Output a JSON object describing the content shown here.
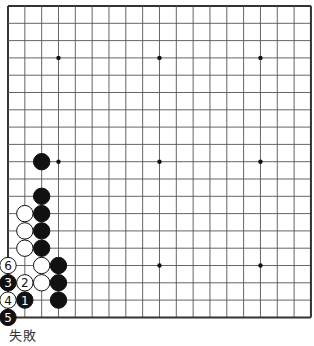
{
  "board": {
    "size": 19,
    "origin_x": 8,
    "origin_y": 6,
    "step_x": 16.83,
    "step_y": 17.3,
    "line_color": "#555555",
    "border_color": "#333333",
    "star_points": [
      [
        3,
        3
      ],
      [
        9,
        3
      ],
      [
        15,
        3
      ],
      [
        3,
        9
      ],
      [
        9,
        9
      ],
      [
        15,
        9
      ],
      [
        3,
        15
      ],
      [
        9,
        15
      ],
      [
        15,
        15
      ]
    ],
    "stones": [
      {
        "color": "black",
        "col": 2,
        "row": 9,
        "label": ""
      },
      {
        "color": "black",
        "col": 2,
        "row": 11,
        "label": ""
      },
      {
        "color": "black",
        "col": 2,
        "row": 12,
        "label": ""
      },
      {
        "color": "black",
        "col": 2,
        "row": 13,
        "label": ""
      },
      {
        "color": "black",
        "col": 2,
        "row": 14,
        "label": ""
      },
      {
        "color": "white",
        "col": 1,
        "row": 12,
        "label": ""
      },
      {
        "color": "white",
        "col": 1,
        "row": 13,
        "label": ""
      },
      {
        "color": "white",
        "col": 1,
        "row": 14,
        "label": ""
      },
      {
        "color": "white",
        "col": 2,
        "row": 15,
        "label": ""
      },
      {
        "color": "black",
        "col": 3,
        "row": 15,
        "label": ""
      },
      {
        "color": "white",
        "col": 2,
        "row": 16,
        "label": ""
      },
      {
        "color": "black",
        "col": 3,
        "row": 16,
        "label": ""
      },
      {
        "color": "black",
        "col": 3,
        "row": 17,
        "label": ""
      },
      {
        "color": "black",
        "col": 1,
        "row": 17,
        "label": "1"
      },
      {
        "color": "white",
        "col": 1,
        "row": 16,
        "label": "2"
      },
      {
        "color": "black",
        "col": 0,
        "row": 16,
        "label": "3"
      },
      {
        "color": "white",
        "col": 0,
        "row": 17,
        "label": "4"
      },
      {
        "color": "black",
        "col": 0,
        "row": 18,
        "label": "5"
      },
      {
        "color": "white",
        "col": 0,
        "row": 15,
        "label": "6"
      }
    ]
  },
  "caption": "失敗"
}
